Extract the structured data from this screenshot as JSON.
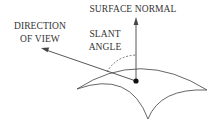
{
  "diagram": {
    "labels": {
      "surface_normal": "SURFACE NORMAL",
      "direction_of_view_line1": "DIRECTION",
      "direction_of_view_line2": "OF VIEW",
      "slant_angle_line1": "SLANT",
      "slant_angle_line2": "ANGLE"
    },
    "colors": {
      "background": "#ffffff",
      "stroke": "#444444",
      "text": "#333333",
      "point": "#111111"
    },
    "elements": [
      "surface-patch",
      "surface-normal-arrow",
      "direction-of-view-arrow",
      "slant-angle-arc",
      "surface-point"
    ]
  }
}
